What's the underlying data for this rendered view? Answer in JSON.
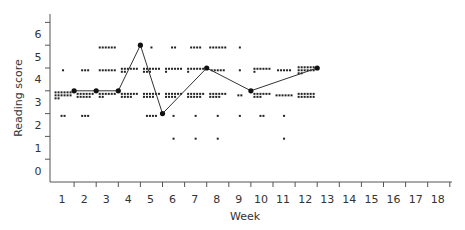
{
  "chart_data": {
    "type": "scatter",
    "title": "",
    "xlabel": "Week",
    "ylabel": "Reading score",
    "x_ticks": [
      "1",
      "2",
      "3",
      "4",
      "5",
      "6",
      "7",
      "8",
      "9",
      "10",
      "11",
      "12",
      "13",
      "14",
      "15",
      "16",
      "17",
      "18"
    ],
    "y_ticks": [
      "0",
      "1",
      "2",
      "3",
      "4",
      "5",
      "6"
    ],
    "xlim": [
      0.5,
      18.5
    ],
    "ylim": [
      -0.5,
      6.5
    ],
    "grid": false,
    "legend": null,
    "series": [
      {
        "name": "Individual scores (dot clusters)",
        "type": "scatter",
        "clusters": [
          {
            "week": 1,
            "score": 4.4,
            "count": 1
          },
          {
            "week": 1,
            "score": 3.3,
            "count": 14
          },
          {
            "week": 1,
            "score": 2.4,
            "count": 2
          },
          {
            "week": 2,
            "score": 4.4,
            "count": 3
          },
          {
            "week": 2,
            "score": 3.3,
            "count": 11
          },
          {
            "week": 2,
            "score": 2.4,
            "count": 3
          },
          {
            "week": 3,
            "score": 5.4,
            "count": 6
          },
          {
            "week": 3,
            "score": 4.4,
            "count": 6
          },
          {
            "week": 3,
            "score": 3.3,
            "count": 8
          },
          {
            "week": 4,
            "score": 4.4,
            "count": 8
          },
          {
            "week": 4,
            "score": 3.3,
            "count": 10
          },
          {
            "week": 5,
            "score": 5.4,
            "count": 1
          },
          {
            "week": 5,
            "score": 4.4,
            "count": 9
          },
          {
            "week": 5,
            "score": 3.3,
            "count": 10
          },
          {
            "week": 5,
            "score": 2.4,
            "count": 4
          },
          {
            "week": 6,
            "score": 5.4,
            "count": 2
          },
          {
            "week": 6,
            "score": 4.4,
            "count": 7
          },
          {
            "week": 6,
            "score": 3.3,
            "count": 10
          },
          {
            "week": 6,
            "score": 2.4,
            "count": 1
          },
          {
            "week": 6,
            "score": 1.4,
            "count": 1
          },
          {
            "week": 7,
            "score": 5.4,
            "count": 4
          },
          {
            "week": 7,
            "score": 4.4,
            "count": 7
          },
          {
            "week": 7,
            "score": 3.3,
            "count": 11
          },
          {
            "week": 7,
            "score": 2.4,
            "count": 1
          },
          {
            "week": 7,
            "score": 1.4,
            "count": 1
          },
          {
            "week": 8,
            "score": 5.4,
            "count": 6
          },
          {
            "week": 8,
            "score": 4.4,
            "count": 5
          },
          {
            "week": 8,
            "score": 3.3,
            "count": 10
          },
          {
            "week": 8,
            "score": 2.4,
            "count": 1
          },
          {
            "week": 8,
            "score": 1.4,
            "count": 1
          },
          {
            "week": 9,
            "score": 5.4,
            "count": 1
          },
          {
            "week": 9,
            "score": 4.4,
            "count": 1
          },
          {
            "week": 9,
            "score": 3.3,
            "count": 2
          },
          {
            "week": 9,
            "score": 2.4,
            "count": 1
          },
          {
            "week": 10,
            "score": 4.4,
            "count": 7
          },
          {
            "week": 10,
            "score": 3.3,
            "count": 9
          },
          {
            "week": 10,
            "score": 2.4,
            "count": 2
          },
          {
            "week": 11,
            "score": 4.4,
            "count": 5
          },
          {
            "week": 11,
            "score": 3.3,
            "count": 6
          },
          {
            "week": 11,
            "score": 2.4,
            "count": 1
          },
          {
            "week": 11,
            "score": 1.4,
            "count": 1
          },
          {
            "week": 12,
            "score": 4.4,
            "count": 14
          },
          {
            "week": 12,
            "score": 3.3,
            "count": 12
          }
        ]
      },
      {
        "name": "Group median",
        "type": "line",
        "x": [
          1.5,
          2.5,
          3.5,
          4.5,
          5.5,
          7.5,
          9.5,
          12.5
        ],
        "values": [
          3.5,
          3.5,
          3.5,
          5.5,
          2.5,
          4.5,
          3.5,
          4.5
        ]
      }
    ]
  }
}
